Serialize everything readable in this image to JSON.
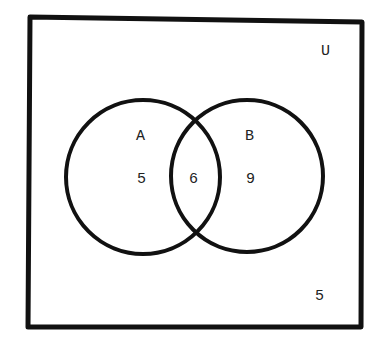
{
  "diagram": {
    "type": "venn",
    "universe": {
      "label": "U",
      "outside_count": "5"
    },
    "sets": [
      {
        "label": "A",
        "only_count": "5"
      },
      {
        "label": "B",
        "only_count": "9"
      }
    ],
    "intersection_count": "6",
    "colors": {
      "stroke": "#111111",
      "background": "#ffffff"
    }
  }
}
